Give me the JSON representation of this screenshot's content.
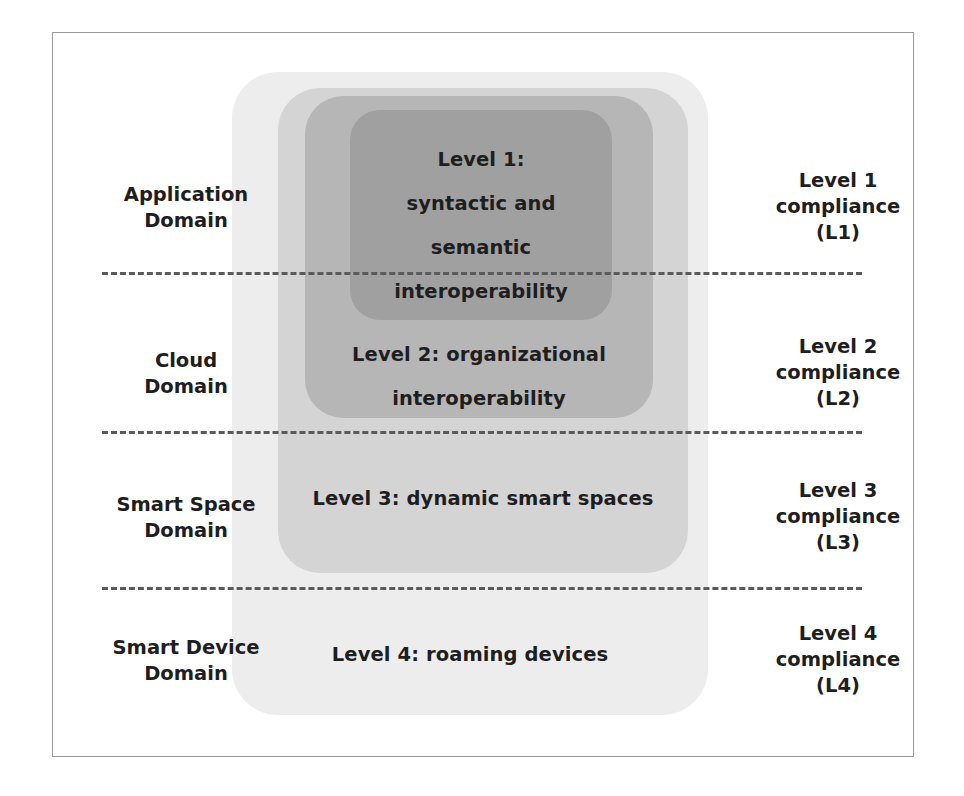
{
  "figure": {
    "frame_border_color": "#9a9a9a",
    "background": "#ffffff"
  },
  "layers": [
    {
      "id": "l1",
      "name": "Level 1",
      "color": "#a0a0a0",
      "lines": [
        "Level 1:",
        "syntactic and",
        "semantic",
        "interoperability"
      ]
    },
    {
      "id": "l2",
      "name": "Level 2",
      "color": "#b6b6b6",
      "lines": [
        "Level 2: organizational",
        "interoperability"
      ]
    },
    {
      "id": "l3",
      "name": "Level 3",
      "color": "#d4d4d4",
      "lines": [
        "Level 3: dynamic smart spaces"
      ]
    },
    {
      "id": "l4",
      "name": "Level 4",
      "color": "#ededed",
      "lines": [
        "Level 4: roaming devices"
      ]
    }
  ],
  "left_labels": [
    {
      "id": "application",
      "lines": [
        "Application",
        "Domain"
      ]
    },
    {
      "id": "cloud",
      "lines": [
        "Cloud",
        "Domain"
      ]
    },
    {
      "id": "smart-space",
      "lines": [
        "Smart Space",
        "Domain"
      ]
    },
    {
      "id": "smart-device",
      "lines": [
        "Smart Device",
        "Domain"
      ]
    }
  ],
  "right_labels": [
    {
      "id": "l1",
      "lines": [
        "Level 1",
        "compliance",
        "(L1)"
      ]
    },
    {
      "id": "l2",
      "lines": [
        "Level 2",
        "compliance",
        "(L2)"
      ]
    },
    {
      "id": "l3",
      "lines": [
        "Level 3",
        "compliance",
        "(L3)"
      ]
    },
    {
      "id": "l4",
      "lines": [
        "Level 4",
        "compliance",
        "(L4)"
      ]
    }
  ],
  "dividers": {
    "count": 3,
    "style": "dashed",
    "color": "#5a5a5a"
  }
}
